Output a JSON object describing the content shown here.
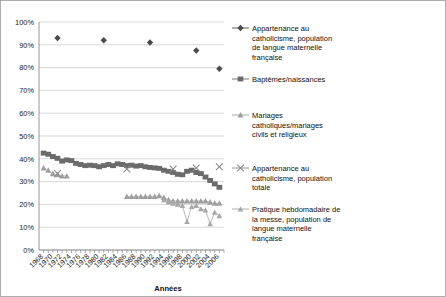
{
  "chart": {
    "type": "line",
    "xlabel": "Années",
    "ylabel": "",
    "title": "",
    "ylim": [
      0,
      100
    ],
    "ytick_suffix": "%",
    "grid": true,
    "legend_position": "right"
  },
  "axis": {
    "y_ticks": [
      "0%",
      "10%",
      "20%",
      "30%",
      "40%",
      "50%",
      "60%",
      "70%",
      "80%",
      "90%",
      "100%"
    ],
    "x_ticks": [
      "1968",
      "1970",
      "1972",
      "1974",
      "1976",
      "1978",
      "1980",
      "1982",
      "1984",
      "1986",
      "1988",
      "1990",
      "1992",
      "1994",
      "1996",
      "1998",
      "2000",
      "2002",
      "2004",
      "2006"
    ],
    "x_label": "Années"
  },
  "legend": {
    "items": [
      {
        "label": "Appartenance au catholicisme, population de langue maternelle française",
        "marker": "diamond",
        "color": "#4a4a4a"
      },
      {
        "label": "Baptêmes/naissances",
        "marker": "square",
        "color": "#6b6b6b"
      },
      {
        "label": "Mariages catholiques/mariages civils et religieux",
        "marker": "triangle",
        "color": "#9e9e9e"
      },
      {
        "label": "Appartenance au catholicisme, population totale",
        "marker": "cross",
        "color": "#8a8a8a"
      },
      {
        "label": "Pratique hebdomadaire de la messe, population de langue maternelle française",
        "marker": "triangle-small",
        "color": "#a8a8a8"
      }
    ]
  },
  "chart_data": {
    "type": "line",
    "title": "",
    "xlabel": "Années",
    "ylabel": "",
    "ylim": [
      0,
      100
    ],
    "grid": true,
    "legend_position": "right",
    "x": [
      1968,
      1969,
      1970,
      1971,
      1972,
      1973,
      1974,
      1975,
      1976,
      1977,
      1978,
      1979,
      1980,
      1981,
      1982,
      1983,
      1984,
      1985,
      1986,
      1987,
      1988,
      1989,
      1990,
      1991,
      1992,
      1993,
      1994,
      1995,
      1996,
      1997,
      1998,
      1999,
      2000,
      2001,
      2002,
      2003,
      2004,
      2005,
      2006
    ],
    "series": [
      {
        "name": "Appartenance au catholicisme, population de langue maternelle française",
        "marker": "diamond",
        "color": "#4a4a4a",
        "points": [
          {
            "x": 1971,
            "y": 93
          },
          {
            "x": 1981,
            "y": 92
          },
          {
            "x": 1991,
            "y": 91
          },
          {
            "x": 2001,
            "y": 87.5
          },
          {
            "x": 2006,
            "y": 79.5
          }
        ]
      },
      {
        "name": "Baptêmes/naissances",
        "marker": "square",
        "color": "#6b6b6b",
        "points": [
          {
            "x": 1968,
            "y": 42.5
          },
          {
            "x": 1969,
            "y": 42.0
          },
          {
            "x": 1970,
            "y": 41.0
          },
          {
            "x": 1971,
            "y": 40.2
          },
          {
            "x": 1972,
            "y": 39.0
          },
          {
            "x": 1973,
            "y": 39.5
          },
          {
            "x": 1974,
            "y": 39.2
          },
          {
            "x": 1975,
            "y": 38.0
          },
          {
            "x": 1976,
            "y": 37.5
          },
          {
            "x": 1977,
            "y": 37.0
          },
          {
            "x": 1978,
            "y": 37.2
          },
          {
            "x": 1979,
            "y": 37.0
          },
          {
            "x": 1980,
            "y": 36.5
          },
          {
            "x": 1981,
            "y": 37.0
          },
          {
            "x": 1982,
            "y": 37.5
          },
          {
            "x": 1983,
            "y": 37.0
          },
          {
            "x": 1984,
            "y": 37.8
          },
          {
            "x": 1985,
            "y": 37.5
          },
          {
            "x": 1986,
            "y": 37.0
          },
          {
            "x": 1987,
            "y": 37.2
          },
          {
            "x": 1988,
            "y": 36.8
          },
          {
            "x": 1989,
            "y": 37.0
          },
          {
            "x": 1990,
            "y": 36.5
          },
          {
            "x": 1991,
            "y": 36.2
          },
          {
            "x": 1992,
            "y": 36.0
          },
          {
            "x": 1993,
            "y": 35.8
          },
          {
            "x": 1994,
            "y": 35.0
          },
          {
            "x": 1995,
            "y": 34.5
          },
          {
            "x": 1996,
            "y": 34.0
          },
          {
            "x": 1997,
            "y": 33.2
          },
          {
            "x": 1998,
            "y": 33.0
          },
          {
            "x": 1999,
            "y": 34.5
          },
          {
            "x": 2000,
            "y": 35.0
          },
          {
            "x": 2001,
            "y": 34.0
          },
          {
            "x": 2002,
            "y": 33.5
          },
          {
            "x": 2003,
            "y": 32.0
          },
          {
            "x": 2004,
            "y": 30.5
          },
          {
            "x": 2005,
            "y": 29.0
          },
          {
            "x": 2006,
            "y": 27.5
          }
        ]
      },
      {
        "name": "Mariages catholiques/mariages civils et religieux",
        "marker": "triangle",
        "color": "#9e9e9e",
        "points": [
          {
            "x": 1968,
            "y": 36.0
          },
          {
            "x": 1969,
            "y": 35.0
          },
          {
            "x": 1970,
            "y": 33.5
          },
          {
            "x": 1971,
            "y": 33.0
          },
          {
            "x": 1972,
            "y": 32.5
          },
          {
            "x": 1973,
            "y": 32.5
          },
          {
            "x": 1986,
            "y": 23.5
          },
          {
            "x": 1987,
            "y": 23.5
          },
          {
            "x": 1988,
            "y": 23.5
          },
          {
            "x": 1989,
            "y": 23.5
          },
          {
            "x": 1990,
            "y": 23.5
          },
          {
            "x": 1991,
            "y": 23.5
          },
          {
            "x": 1992,
            "y": 23.5
          },
          {
            "x": 1993,
            "y": 23.8
          },
          {
            "x": 1994,
            "y": 23.0
          },
          {
            "x": 1995,
            "y": 22.0
          },
          {
            "x": 1996,
            "y": 21.5
          },
          {
            "x": 1997,
            "y": 21.5
          },
          {
            "x": 1998,
            "y": 21.5
          },
          {
            "x": 1999,
            "y": 21.5
          },
          {
            "x": 2000,
            "y": 21.5
          },
          {
            "x": 2001,
            "y": 21.5
          },
          {
            "x": 2002,
            "y": 21.5
          },
          {
            "x": 2003,
            "y": 21.5
          },
          {
            "x": 2004,
            "y": 21.0
          },
          {
            "x": 2005,
            "y": 20.5
          },
          {
            "x": 2006,
            "y": 20.5
          }
        ]
      },
      {
        "name": "Appartenance au catholicisme, population totale",
        "marker": "cross",
        "color": "#8a8a8a",
        "points": [
          {
            "x": 1971,
            "y": 33.5
          },
          {
            "x": 1986,
            "y": 35.5
          },
          {
            "x": 1996,
            "y": 35.5
          },
          {
            "x": 2001,
            "y": 36.0
          },
          {
            "x": 2006,
            "y": 36.5
          }
        ]
      },
      {
        "name": "Pratique hebdomadaire de la messe, population de langue maternelle française",
        "marker": "triangle-small",
        "color": "#a8a8a8",
        "points": [
          {
            "x": 1994,
            "y": 22.0
          },
          {
            "x": 1995,
            "y": 21.0
          },
          {
            "x": 1996,
            "y": 20.5
          },
          {
            "x": 1997,
            "y": 20.0
          },
          {
            "x": 1998,
            "y": 19.5
          },
          {
            "x": 1999,
            "y": 12.5
          },
          {
            "x": 2000,
            "y": 19.0
          },
          {
            "x": 2001,
            "y": 19.5
          },
          {
            "x": 2002,
            "y": 18.0
          },
          {
            "x": 2003,
            "y": 17.5
          },
          {
            "x": 2004,
            "y": 11.5
          },
          {
            "x": 2005,
            "y": 16.5
          },
          {
            "x": 2006,
            "y": 15.0
          }
        ]
      }
    ]
  }
}
